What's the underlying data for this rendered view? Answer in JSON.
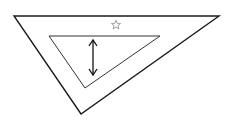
{
  "diagram": {
    "outer_triangle": {
      "points": [
        [
          14,
          16
        ],
        [
          219,
          16
        ],
        [
          81,
          114
        ]
      ],
      "stroke": "#1a1a1a",
      "stroke_width": 1.4
    },
    "inner_triangle": {
      "points": [
        [
          49,
          36
        ],
        [
          160,
          36
        ],
        [
          85,
          88
        ]
      ],
      "stroke": "#333333",
      "stroke_width": 1
    },
    "star": {
      "cx": 116,
      "cy": 25,
      "r_outer": 4.8,
      "r_inner": 2.1,
      "stroke": "#888888"
    },
    "double_arrow": {
      "x": 93,
      "y1": 40,
      "y2": 75,
      "stroke": "#111111"
    },
    "colors": {
      "background": "#ffffff"
    }
  }
}
